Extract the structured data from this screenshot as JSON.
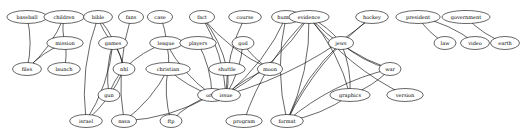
{
  "diagram": {
    "type": "undirected-graph",
    "nodes": [
      {
        "id": "baseball",
        "label": "baseball",
        "x": 27,
        "y": 17
      },
      {
        "id": "children",
        "label": "children",
        "x": 64,
        "y": 17
      },
      {
        "id": "mission",
        "label": "mission",
        "x": 65,
        "y": 43
      },
      {
        "id": "files",
        "label": "files",
        "x": 27,
        "y": 69
      },
      {
        "id": "launch",
        "label": "launch",
        "x": 64,
        "y": 69
      },
      {
        "id": "bible",
        "label": "bible",
        "x": 98,
        "y": 17
      },
      {
        "id": "fans",
        "label": "fans",
        "x": 131,
        "y": 17
      },
      {
        "id": "games",
        "label": "games",
        "x": 113,
        "y": 43
      },
      {
        "id": "nhl",
        "label": "nhl",
        "x": 124,
        "y": 69
      },
      {
        "id": "gun",
        "label": "gun",
        "x": 109,
        "y": 95
      },
      {
        "id": "israel",
        "label": "israel",
        "x": 86,
        "y": 121
      },
      {
        "id": "nasa",
        "label": "nasa",
        "x": 124,
        "y": 121
      },
      {
        "id": "case",
        "label": "case",
        "x": 160,
        "y": 17
      },
      {
        "id": "league",
        "label": "league",
        "x": 166,
        "y": 43
      },
      {
        "id": "players",
        "label": "players",
        "x": 198,
        "y": 43
      },
      {
        "id": "christian",
        "label": "christian",
        "x": 168,
        "y": 69
      },
      {
        "id": "orbit",
        "label": "orbit",
        "x": 212,
        "y": 95
      },
      {
        "id": "ftp",
        "label": "ftp",
        "x": 171,
        "y": 121
      },
      {
        "id": "fact",
        "label": "fact",
        "x": 202,
        "y": 17
      },
      {
        "id": "course",
        "label": "course",
        "x": 245,
        "y": 17
      },
      {
        "id": "human",
        "label": "human",
        "x": 286,
        "y": 17
      },
      {
        "id": "god",
        "label": "god",
        "x": 243,
        "y": 43
      },
      {
        "id": "shuttle",
        "label": "shuttle",
        "x": 227,
        "y": 69
      },
      {
        "id": "moon",
        "label": "moon",
        "x": 270,
        "y": 69
      },
      {
        "id": "issue",
        "label": "issue",
        "x": 226,
        "y": 95
      },
      {
        "id": "program",
        "label": "program",
        "x": 244,
        "y": 121
      },
      {
        "id": "evidence",
        "label": "evidence",
        "x": 309,
        "y": 17
      },
      {
        "id": "hockey",
        "label": "hockey",
        "x": 372,
        "y": 17
      },
      {
        "id": "president",
        "label": "president",
        "x": 418,
        "y": 17
      },
      {
        "id": "government",
        "label": "government",
        "x": 466,
        "y": 17
      },
      {
        "id": "jews",
        "label": "jews",
        "x": 341,
        "y": 43
      },
      {
        "id": "war",
        "label": "war",
        "x": 390,
        "y": 69
      },
      {
        "id": "graphics",
        "label": "graphics",
        "x": 350,
        "y": 95
      },
      {
        "id": "version",
        "label": "version",
        "x": 405,
        "y": 95
      },
      {
        "id": "format",
        "label": "format",
        "x": 287,
        "y": 121
      },
      {
        "id": "law",
        "label": "law",
        "x": 445,
        "y": 43
      },
      {
        "id": "video",
        "label": "video",
        "x": 475,
        "y": 43
      },
      {
        "id": "earth",
        "label": "earth",
        "x": 505,
        "y": 43
      }
    ],
    "edges": [
      [
        "baseball",
        "files"
      ],
      [
        "children",
        "mission"
      ],
      [
        "children",
        "files"
      ],
      [
        "mission",
        "files"
      ],
      [
        "mission",
        "launch"
      ],
      [
        "bible",
        "games"
      ],
      [
        "bible",
        "nhl"
      ],
      [
        "bible",
        "israel"
      ],
      [
        "games",
        "nhl"
      ],
      [
        "games",
        "gun"
      ],
      [
        "games",
        "israel"
      ],
      [
        "nhl",
        "gun"
      ],
      [
        "nhl",
        "israel"
      ],
      [
        "fans",
        "nasa"
      ],
      [
        "case",
        "league"
      ],
      [
        "league",
        "nhl"
      ],
      [
        "league",
        "christian"
      ],
      [
        "league",
        "orbit"
      ],
      [
        "players",
        "orbit"
      ],
      [
        "christian",
        "orbit"
      ],
      [
        "christian",
        "nasa"
      ],
      [
        "christian",
        "ftp"
      ],
      [
        "orbit",
        "nasa"
      ],
      [
        "orbit",
        "ftp"
      ],
      [
        "fact",
        "shuttle"
      ],
      [
        "fact",
        "moon"
      ],
      [
        "fact",
        "issue"
      ],
      [
        "course",
        "issue"
      ],
      [
        "human",
        "issue"
      ],
      [
        "human",
        "format"
      ],
      [
        "god",
        "issue"
      ],
      [
        "god",
        "moon"
      ],
      [
        "shuttle",
        "issue"
      ],
      [
        "moon",
        "issue"
      ],
      [
        "evidence",
        "issue"
      ],
      [
        "evidence",
        "program"
      ],
      [
        "evidence",
        "jews"
      ],
      [
        "evidence",
        "war"
      ],
      [
        "evidence",
        "graphics"
      ],
      [
        "evidence",
        "version"
      ],
      [
        "evidence",
        "format"
      ],
      [
        "jews",
        "war"
      ],
      [
        "jews",
        "graphics"
      ],
      [
        "jews",
        "format"
      ],
      [
        "war",
        "graphics"
      ],
      [
        "war",
        "format"
      ],
      [
        "graphics",
        "format"
      ],
      [
        "hockey",
        "format"
      ],
      [
        "hockey",
        "issue"
      ],
      [
        "president",
        "law"
      ],
      [
        "president",
        "video"
      ],
      [
        "government",
        "earth"
      ]
    ]
  }
}
